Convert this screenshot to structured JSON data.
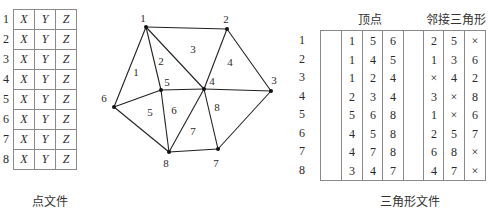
{
  "point_file": {
    "caption": "点文件",
    "row_indices": [
      "1",
      "2",
      "3",
      "4",
      "5",
      "6",
      "7",
      "8"
    ],
    "columns": [
      "X",
      "Y",
      "Z"
    ],
    "rows": [
      [
        "X",
        "Y",
        "Z"
      ],
      [
        "X",
        "Y",
        "Z"
      ],
      [
        "X",
        "Y",
        "Z"
      ],
      [
        "X",
        "Y",
        "Z"
      ],
      [
        "X",
        "Y",
        "Z"
      ],
      [
        "X",
        "Y",
        "Z"
      ],
      [
        "X",
        "Y",
        "Z"
      ],
      [
        "X",
        "Y",
        "Z"
      ]
    ]
  },
  "mesh": {
    "nodes": [
      {
        "id": "1",
        "x": 146,
        "y": 27,
        "lx": 143,
        "ly": 22
      },
      {
        "id": "2",
        "x": 227,
        "y": 29,
        "lx": 226,
        "ly": 23
      },
      {
        "id": "3",
        "x": 271,
        "y": 91,
        "lx": 274,
        "ly": 84
      },
      {
        "id": "4",
        "x": 204,
        "y": 89,
        "lx": 212,
        "ly": 85
      },
      {
        "id": "5",
        "x": 161,
        "y": 90,
        "lx": 167,
        "ly": 86
      },
      {
        "id": "6",
        "x": 114,
        "y": 107,
        "lx": 104,
        "ly": 102
      },
      {
        "id": "7",
        "x": 218,
        "y": 149,
        "lx": 216,
        "ly": 167
      },
      {
        "id": "8",
        "x": 169,
        "y": 152,
        "lx": 166,
        "ly": 167
      }
    ],
    "triangles": [
      {
        "id": "1",
        "x": 136,
        "y": 76
      },
      {
        "id": "2",
        "x": 161,
        "y": 65
      },
      {
        "id": "3",
        "x": 193,
        "y": 53
      },
      {
        "id": "4",
        "x": 230,
        "y": 66
      },
      {
        "id": "5",
        "x": 150,
        "y": 116
      },
      {
        "id": "6",
        "x": 174,
        "y": 114
      },
      {
        "id": "7",
        "x": 193,
        "y": 135
      },
      {
        "id": "8",
        "x": 217,
        "y": 111
      }
    ]
  },
  "triangle_file": {
    "caption": "三角形文件",
    "header_vertices": "顶点",
    "header_neighbors": "邻接三角形",
    "row_indices": [
      "1",
      "2",
      "3",
      "4",
      "5",
      "6",
      "7",
      "8"
    ],
    "vertices": [
      [
        "1",
        "5",
        "6"
      ],
      [
        "1",
        "4",
        "5"
      ],
      [
        "1",
        "2",
        "4"
      ],
      [
        "2",
        "3",
        "4"
      ],
      [
        "5",
        "6",
        "8"
      ],
      [
        "4",
        "5",
        "8"
      ],
      [
        "4",
        "7",
        "8"
      ],
      [
        "3",
        "4",
        "7"
      ]
    ],
    "neighbors": [
      [
        "2",
        "5",
        "×"
      ],
      [
        "1",
        "3",
        "6"
      ],
      [
        "×",
        "4",
        "2"
      ],
      [
        "3",
        "×",
        "8"
      ],
      [
        "1",
        "×",
        "6"
      ],
      [
        "2",
        "5",
        "7"
      ],
      [
        "6",
        "8",
        "×"
      ],
      [
        "4",
        "7",
        "×"
      ]
    ]
  }
}
